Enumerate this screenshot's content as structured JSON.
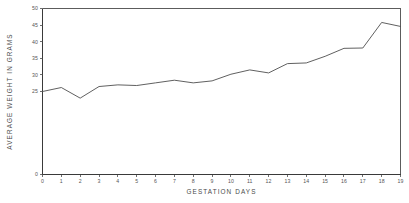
{
  "chart_data": {
    "type": "line",
    "title": "",
    "xlabel": "GESTATION DAYS",
    "ylabel": "AVERAGE WEIGHT IN GRAMS",
    "x": [
      0,
      1,
      2,
      3,
      4,
      5,
      6,
      7,
      8,
      9,
      10,
      11,
      12,
      13,
      14,
      15,
      16,
      17,
      18,
      19
    ],
    "values": [
      25.0,
      26.2,
      23.0,
      26.5,
      27.0,
      26.8,
      27.6,
      28.4,
      27.6,
      28.2,
      30.2,
      31.5,
      30.6,
      33.4,
      33.6,
      35.6,
      38.0,
      38.1,
      45.8,
      44.6
    ],
    "series": [
      {
        "name": "Average weight",
        "values": [
          25.0,
          26.2,
          23.0,
          26.5,
          27.0,
          26.8,
          27.6,
          28.4,
          27.6,
          28.2,
          30.2,
          31.5,
          30.6,
          33.4,
          33.6,
          35.6,
          38.0,
          38.1,
          45.8,
          44.6
        ]
      }
    ],
    "xlim": [
      0,
      19
    ],
    "ylim": [
      0,
      50
    ],
    "xticks": [
      0,
      1,
      2,
      3,
      4,
      5,
      6,
      7,
      8,
      9,
      10,
      11,
      12,
      13,
      14,
      15,
      16,
      17,
      18,
      19
    ],
    "xtick_labels": [
      "0",
      "1",
      "2",
      "3",
      "4",
      "5",
      "6",
      "7",
      "8",
      "9",
      "10",
      "11",
      "12",
      "13",
      "14",
      "15",
      "16",
      "17",
      "18",
      "19"
    ],
    "yticks": [
      0,
      25,
      30,
      35,
      40,
      45,
      50
    ],
    "ytick_labels": [
      "0",
      "25",
      "30",
      "35",
      "40",
      "45",
      "50"
    ],
    "grid": false,
    "legend": false,
    "legend_position": "none",
    "line_color": "#4e4e4e",
    "axis_color": "#3a3a3a",
    "background_color": "#ffffff"
  }
}
